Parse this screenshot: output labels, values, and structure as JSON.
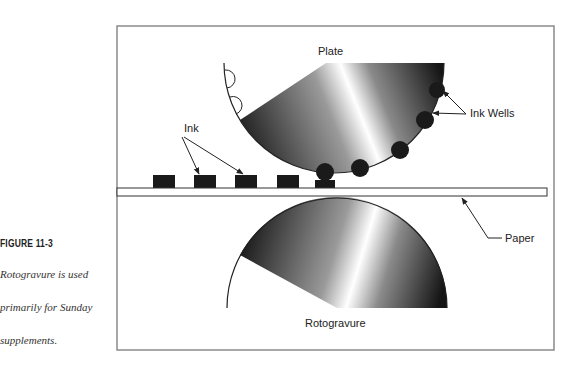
{
  "figure": {
    "label": "FIGURE 11-3",
    "caption_lines": [
      "Rotogravure is used",
      "primarily for Sunday",
      "supplements."
    ]
  },
  "diagram": {
    "labels": {
      "plate": "Plate",
      "ink": "Ink",
      "ink_wells": "Ink Wells",
      "paper": "Paper",
      "rotogravure": "Rotogravure"
    },
    "colors": {
      "frame": "#8a8a8a",
      "ink": "#1a1a1a",
      "gradient_dark": "#111111",
      "gradient_light": "#ffffff"
    }
  }
}
